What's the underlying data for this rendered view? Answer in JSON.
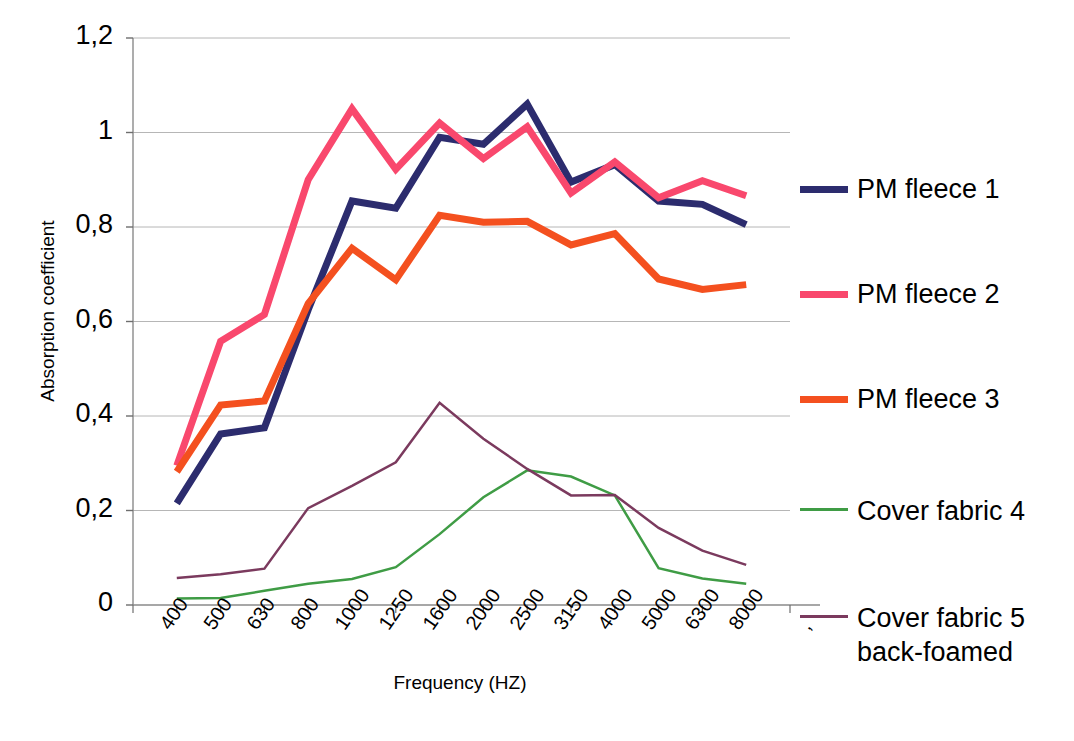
{
  "chart_data": {
    "type": "line",
    "title": "",
    "xlabel": "Frequency (HZ)",
    "ylabel": "Absorption coefficient",
    "categories": [
      "400",
      "500",
      "630",
      "800",
      "1000",
      "1250",
      "1600",
      "2000",
      "2500",
      "3150",
      "4000",
      "5000",
      "6300",
      "8000"
    ],
    "ylim": [
      0,
      1.2
    ],
    "ytick_labels": [
      "0",
      "0,2",
      "0,4",
      "0,6",
      "0,8",
      "1",
      "1,2"
    ],
    "ytick_values": [
      0,
      0.2,
      0.4,
      0.6,
      0.8,
      1.0,
      1.2
    ],
    "grid": true,
    "grid_axis": "y",
    "legend_position": "right",
    "decimal_separator": ",",
    "series": [
      {
        "name": "PM fleece 1",
        "color": "#2c2c6e",
        "width": 7,
        "values": [
          0.215,
          0.362,
          0.375,
          0.625,
          0.855,
          0.84,
          0.99,
          0.975,
          1.06,
          0.895,
          0.932,
          0.855,
          0.848,
          0.805
        ]
      },
      {
        "name": "PM fleece 2",
        "color": "#f9486d",
        "width": 7,
        "values": [
          0.295,
          0.558,
          0.615,
          0.9,
          1.05,
          0.922,
          1.02,
          0.945,
          1.012,
          0.872,
          0.938,
          0.862,
          0.898,
          0.866
        ]
      },
      {
        "name": "PM fleece 3",
        "color": "#f4501f",
        "width": 7,
        "values": [
          0.282,
          0.423,
          0.432,
          0.638,
          0.755,
          0.688,
          0.825,
          0.81,
          0.812,
          0.762,
          0.786,
          0.69,
          0.668,
          0.678
        ]
      },
      {
        "name": "Cover fabric 4",
        "color": "#3f9c45",
        "width": 2.5,
        "values": [
          0.014,
          0.015,
          0.03,
          0.045,
          0.055,
          0.08,
          0.15,
          0.228,
          0.285,
          0.272,
          0.232,
          0.078,
          0.056,
          0.045
        ]
      },
      {
        "name": "Cover fabric 5\nback-foamed",
        "color": "#7b3a5e",
        "width": 2.5,
        "values": [
          0.057,
          0.065,
          0.077,
          0.205,
          0.252,
          0.302,
          0.428,
          0.352,
          0.288,
          0.232,
          0.233,
          0.163,
          0.115,
          0.085
        ]
      }
    ]
  },
  "legend": {
    "items": [
      {
        "label": "PM fleece 1",
        "color": "#2c2c6e",
        "thick": true,
        "top": 172
      },
      {
        "label": "PM fleece 2",
        "color": "#f9486d",
        "thick": true,
        "top": 277
      },
      {
        "label": "PM fleece 3",
        "color": "#f4501f",
        "thick": true,
        "top": 382
      },
      {
        "label": "Cover fabric 4",
        "color": "#3f9c45",
        "thick": false,
        "top": 494
      },
      {
        "label": "Cover fabric 5\nback-foamed",
        "color": "#7b3a5e",
        "thick": false,
        "top": 601
      }
    ]
  },
  "axes": {
    "x_title": "Frequency (HZ)",
    "y_title": "Absorption coefficient"
  }
}
